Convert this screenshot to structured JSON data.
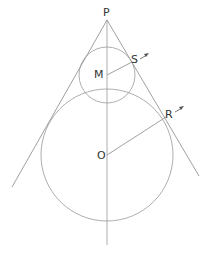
{
  "diagram": {
    "title": "",
    "labels": {
      "apex": "P",
      "small_center": "M",
      "large_center": "O",
      "small_tangent_point": "S",
      "large_tangent_point": "R"
    },
    "elements": {
      "apex_point": {
        "x": 107,
        "y": 20
      },
      "small_circle": {
        "cx": 107,
        "cy": 75,
        "r": 28
      },
      "large_circle": {
        "cx": 107,
        "cy": 155,
        "r": 66
      },
      "axis_line": {
        "x1": 107,
        "y1": 20,
        "x2": 107,
        "y2": 245
      },
      "left_tangent": {
        "x1": 107,
        "y1": 20,
        "x2": 12,
        "y2": 187
      },
      "right_tangent": {
        "x1": 107,
        "y1": 20,
        "x2": 199,
        "y2": 176
      },
      "radius_MS": {
        "x1": 107,
        "y1": 75,
        "x2": 132,
        "y2": 62
      },
      "radius_OR": {
        "x1": 107,
        "y1": 155,
        "x2": 166,
        "y2": 117
      }
    },
    "colors": {
      "line": "#888888",
      "text": "#333333",
      "background": "#ffffff"
    }
  }
}
